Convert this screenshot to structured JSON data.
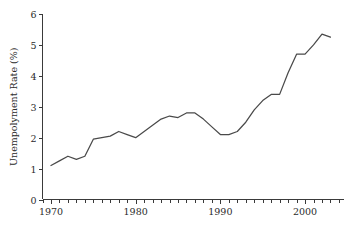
{
  "figure": {
    "background_color": "#ffffff",
    "width": 352,
    "height": 226
  },
  "chart_data": {
    "type": "line",
    "title": "",
    "subtitle": "",
    "xlabel": "",
    "ylabel": "Unempolyment Rate (%)",
    "xlim": [
      1969.0,
      2004.6
    ],
    "ylim": [
      0,
      6
    ],
    "grid": false,
    "legend": false,
    "legend_position": "none",
    "line_color": "#4a4a4a",
    "axis_color": "#3a3a3a",
    "x_tick_labels": [
      "1970",
      "1980",
      "1990",
      "2000"
    ],
    "x_labeled_ticks": [
      1970,
      1980,
      1990,
      2000
    ],
    "x_minor_tick_interval": 1,
    "y_tick_labels": [
      "0",
      "1",
      "2",
      "3",
      "4",
      "5",
      "6"
    ],
    "y_ticks": [
      0,
      1,
      2,
      3,
      4,
      5,
      6
    ],
    "series": [
      {
        "name": "Unemployment Rate",
        "x": [
          1970,
          1971,
          1972,
          1973,
          1974,
          1975,
          1976,
          1977,
          1978,
          1979,
          1980,
          1981,
          1982,
          1983,
          1984,
          1985,
          1986,
          1987,
          1988,
          1989,
          1990,
          1991,
          1992,
          1993,
          1994,
          1995,
          1996,
          1997,
          1998,
          1999,
          2000,
          2001,
          2002,
          2003
        ],
        "values": [
          1.1,
          1.25,
          1.4,
          1.3,
          1.4,
          1.95,
          2.0,
          2.05,
          2.2,
          2.1,
          2.0,
          2.2,
          2.4,
          2.6,
          2.7,
          2.65,
          2.8,
          2.8,
          2.6,
          2.35,
          2.1,
          2.1,
          2.2,
          2.5,
          2.9,
          3.2,
          3.4,
          3.4,
          4.1,
          4.7,
          4.7,
          5.0,
          5.35,
          5.25
        ]
      }
    ]
  }
}
